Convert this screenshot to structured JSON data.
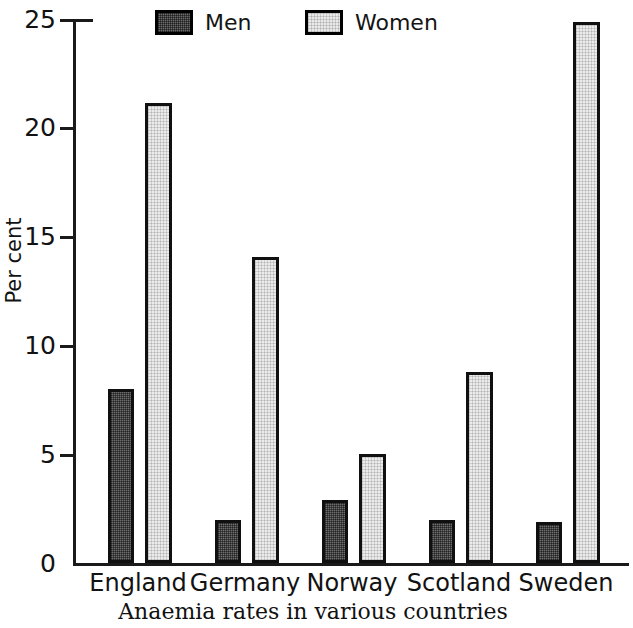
{
  "chart_data": {
    "type": "bar",
    "title": "",
    "caption": "Anaemia rates in various countries",
    "xlabel": "",
    "ylabel": "Per cent",
    "categories": [
      "England",
      "Germany",
      "Norway",
      "Scotland",
      "Sweden"
    ],
    "series": [
      {
        "name": "Men",
        "values": [
          8.0,
          2.0,
          2.9,
          2.0,
          1.9
        ]
      },
      {
        "name": "Women",
        "values": [
          21.2,
          14.1,
          5.0,
          8.8,
          24.9
        ]
      }
    ],
    "ylim": [
      0,
      25
    ],
    "yticks": [
      0,
      5,
      10,
      15,
      20,
      25
    ],
    "ytick_labels": [
      "0",
      "5",
      "10",
      "15",
      "20",
      "25"
    ],
    "grid": false,
    "legend_position": "top",
    "colors": {
      "men_fill": "#6f6f6f",
      "women_fill": "#ebebeb",
      "outline": "#101010",
      "axis": "#1a1a1a",
      "background": "#ffffff"
    }
  },
  "legend": {
    "entries": [
      {
        "label": "Men",
        "swatch": "dark-hatched-swatch"
      },
      {
        "label": "Women",
        "swatch": "light-hatched-swatch"
      }
    ]
  },
  "axes": {
    "y_axis_title": "Per cent",
    "y_tick_labels": [
      "25",
      "20",
      "15",
      "10",
      "5",
      "0"
    ],
    "x_tick_labels": [
      "England",
      "Germany",
      "Norway",
      "Scotland",
      "Sweden"
    ]
  },
  "caption": {
    "text": "Anaemia rates in various countries"
  }
}
